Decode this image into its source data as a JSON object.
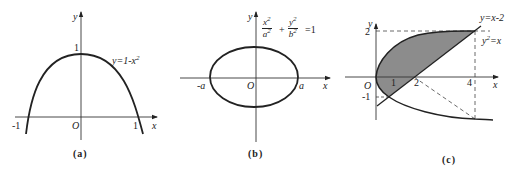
{
  "panels": [
    {
      "id": "a",
      "caption": "(a)",
      "axis_x_label": "x",
      "axis_y_label": "y",
      "origin_label": "O",
      "tick_labels": {
        "x_neg": "-1",
        "x_pos": "1",
        "y_pos": "1"
      },
      "curve_label": "y=1-x",
      "curve_label_exp": "2",
      "curve": "y = 1 - x^2 (downward parabola, vertex (0,1), roots at x=-1 and x=1)"
    },
    {
      "id": "b",
      "caption": "(b)",
      "axis_x_label": "x",
      "axis_y_label": "y",
      "origin_label": "O",
      "tick_labels": {
        "x_neg": "-a",
        "x_pos": "a"
      },
      "equation": {
        "frac1_num": "x",
        "frac1_den": "a",
        "frac2_num": "y",
        "frac2_den": "b",
        "exp": "2",
        "plus": "+",
        "rhs": "=1"
      },
      "curve": "ellipse x^2/a^2 + y^2/b^2 = 1"
    },
    {
      "id": "c",
      "caption": "(c)",
      "axis_x_label": "x",
      "axis_y_label": "y",
      "origin_label": "O",
      "tick_labels": {
        "x1": "1",
        "x2": "2",
        "x4": "4",
        "y2": "2",
        "y_neg1": "-1"
      },
      "line_label": "y=x-2",
      "parabola_label": "y",
      "parabola_label_rest": "=x",
      "parabola_label_exp": "2",
      "region": "shaded region bounded by y^2 = x and y = x - 2, intersections at (1,-1) and (4,2)",
      "colors": {
        "shade": "#8c8c8c",
        "stroke": "#222222"
      }
    }
  ]
}
